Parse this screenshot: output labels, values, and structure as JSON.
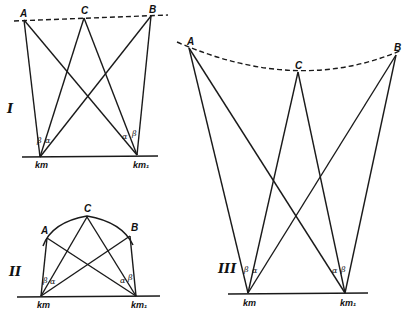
{
  "figure": {
    "panels": [
      {
        "id": "I",
        "label": "I",
        "top_curve": "dashed straight line",
        "points": {
          "A": "A",
          "B": "B",
          "C": "C"
        },
        "stations": {
          "left": "km",
          "right": "km₁"
        },
        "angles": {
          "left": [
            "β",
            "α"
          ],
          "right": [
            "α",
            "β"
          ]
        }
      },
      {
        "id": "II",
        "label": "II",
        "top_curve": "solid arc",
        "points": {
          "A": "A",
          "B": "B",
          "C": "C"
        },
        "stations": {
          "left": "km",
          "right": "km₁"
        },
        "angles": {
          "left": [
            "β",
            "α"
          ],
          "right": [
            "α",
            "β"
          ]
        }
      },
      {
        "id": "III",
        "label": "III",
        "top_curve": "dashed arc",
        "points": {
          "A": "A",
          "B": "B",
          "C": "C"
        },
        "stations": {
          "left": "km",
          "right": "km₁"
        },
        "angles": {
          "left": [
            "β",
            "α"
          ],
          "right": [
            "α",
            "β"
          ]
        }
      }
    ]
  }
}
